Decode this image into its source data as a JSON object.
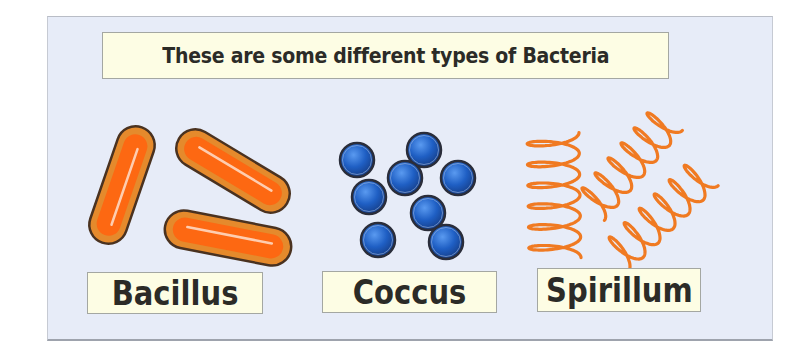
{
  "title": "These are some different types of Bacteria",
  "colors": {
    "panel_background": "#e7ecf8",
    "label_background": "#fdfde4",
    "text": "#2b2b27",
    "bacillus_outline": "#4a3220",
    "bacillus_outer": "#e58a2c",
    "bacillus_inner": "#ff6410",
    "bacillus_highlight": "#ffd9c2",
    "coccus_outline": "#2a2d3a",
    "coccus_fill": "#1f5fc4",
    "coccus_light": "#4d8ee8",
    "spirillum_stroke": "#f07a22"
  },
  "bacteria": [
    {
      "type": "bacillus",
      "label": "Bacillus",
      "shape": "rod",
      "count": 3,
      "items": [
        {
          "cx": 122,
          "cy": 185,
          "length": 122,
          "width": 38,
          "angle": 109
        },
        {
          "cx": 233,
          "cy": 171,
          "length": 126,
          "width": 38,
          "angle": 31
        },
        {
          "cx": 228,
          "cy": 238,
          "length": 128,
          "width": 38,
          "angle": 11
        }
      ]
    },
    {
      "type": "coccus",
      "label": "Coccus",
      "shape": "sphere",
      "count": 8,
      "items": [
        {
          "cx": 357,
          "cy": 160,
          "r": 17
        },
        {
          "cx": 424,
          "cy": 150,
          "r": 17
        },
        {
          "cx": 405,
          "cy": 178,
          "r": 17
        },
        {
          "cx": 458,
          "cy": 178,
          "r": 17
        },
        {
          "cx": 369,
          "cy": 197,
          "r": 17
        },
        {
          "cx": 428,
          "cy": 213,
          "r": 17
        },
        {
          "cx": 378,
          "cy": 240,
          "r": 17
        },
        {
          "cx": 446,
          "cy": 242,
          "r": 17
        }
      ]
    },
    {
      "type": "spirillum",
      "label": "Spirillum",
      "shape": "helix",
      "count": 3,
      "items": [
        {
          "x1": 555,
          "y1": 258,
          "x2": 553,
          "y2": 133,
          "loops": 6,
          "amp": 26
        },
        {
          "x1": 590,
          "y1": 208,
          "x2": 668,
          "y2": 118,
          "loops": 6,
          "amp": 19
        },
        {
          "x1": 615,
          "y1": 258,
          "x2": 705,
          "y2": 172,
          "loops": 6,
          "amp": 19
        }
      ]
    }
  ]
}
